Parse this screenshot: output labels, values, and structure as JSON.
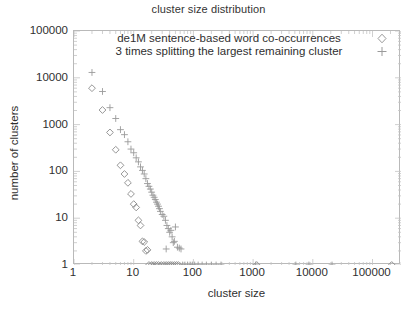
{
  "chart_data": {
    "type": "scatter",
    "title": "cluster size distribution",
    "xlabel": "cluster size",
    "ylabel": "number of clusters",
    "xscale": "log",
    "yscale": "log",
    "xlim": [
      1,
      300000
    ],
    "ylim": [
      1,
      100000
    ],
    "xticks": [
      1,
      10,
      100,
      1000,
      10000,
      100000
    ],
    "xtick_labels": [
      "1",
      "10",
      "100",
      "1000",
      "10000",
      "100000"
    ],
    "yticks": [
      1,
      10,
      100,
      1000,
      10000,
      100000
    ],
    "ytick_labels": [
      "1",
      "10",
      "100",
      "1000",
      "10000",
      "100000"
    ],
    "grid": false,
    "minor_ticks": true,
    "legend_position": "top-center-inside",
    "series": [
      {
        "name": "de1M sentence-based word co-occurrences",
        "marker": "diamond",
        "color": "#8a8a8a",
        "points": [
          [
            2,
            6000
          ],
          [
            3,
            2050
          ],
          [
            4,
            680
          ],
          [
            5,
            290
          ],
          [
            6,
            135
          ],
          [
            7,
            88
          ],
          [
            8,
            57
          ],
          [
            9,
            33
          ],
          [
            10,
            20
          ],
          [
            11,
            17
          ],
          [
            12,
            9
          ],
          [
            13,
            7
          ],
          [
            14,
            3.2
          ],
          [
            15,
            3.1
          ],
          [
            16,
            2
          ],
          [
            17,
            2.1
          ],
          [
            18,
            1
          ],
          [
            20,
            1
          ],
          [
            22,
            1
          ],
          [
            24,
            1
          ],
          [
            26,
            1
          ],
          [
            29,
            1
          ],
          [
            32,
            1
          ],
          [
            35,
            1
          ],
          [
            38,
            1
          ],
          [
            41,
            1
          ],
          [
            44,
            1
          ],
          [
            48,
            1
          ],
          [
            52,
            1
          ],
          [
            56,
            1
          ],
          [
            1150,
            1
          ],
          [
            210000,
            1
          ]
        ]
      },
      {
        "name": "3 times splitting the largest remaining cluster",
        "marker": "plus",
        "color": "#9a9a9a",
        "points": [
          [
            2,
            13000
          ],
          [
            3,
            5100
          ],
          [
            4,
            2300
          ],
          [
            5,
            1350
          ],
          [
            6,
            780
          ],
          [
            7,
            610
          ],
          [
            8,
            430
          ],
          [
            9,
            300
          ],
          [
            10,
            250
          ],
          [
            11,
            195
          ],
          [
            12,
            160
          ],
          [
            13,
            125
          ],
          [
            14,
            105
          ],
          [
            15,
            88
          ],
          [
            16,
            70
          ],
          [
            17,
            55
          ],
          [
            18,
            48
          ],
          [
            19,
            42
          ],
          [
            20,
            36
          ],
          [
            21,
            31
          ],
          [
            22,
            28
          ],
          [
            23,
            25
          ],
          [
            24,
            22
          ],
          [
            25,
            20
          ],
          [
            26,
            18
          ],
          [
            27,
            16
          ],
          [
            28,
            14
          ],
          [
            30,
            12
          ],
          [
            32,
            11
          ],
          [
            34,
            9
          ],
          [
            36,
            7
          ],
          [
            38,
            6
          ],
          [
            40,
            5
          ],
          [
            42,
            5.5
          ],
          [
            44,
            4
          ],
          [
            46,
            3
          ],
          [
            48,
            3.2
          ],
          [
            50,
            6.5
          ],
          [
            54,
            2.4
          ],
          [
            58,
            2.3
          ],
          [
            62,
            2.2
          ],
          [
            35,
            2.2
          ],
          [
            66,
            1
          ],
          [
            72,
            1
          ],
          [
            80,
            1
          ],
          [
            88,
            1
          ],
          [
            96,
            1
          ],
          [
            105,
            1
          ],
          [
            120,
            1
          ],
          [
            140,
            1
          ],
          [
            165,
            1
          ],
          [
            200,
            1
          ],
          [
            240,
            1
          ],
          [
            290,
            1
          ],
          [
            1100,
            1
          ],
          [
            5200,
            1
          ],
          [
            8600,
            1
          ],
          [
            21000,
            1
          ]
        ]
      }
    ]
  },
  "axes": {
    "title": "cluster size distribution",
    "x_title": "cluster size",
    "y_title": "number of clusters"
  },
  "legend": {
    "entries": [
      {
        "label": "de1M sentence-based word co-occurrences",
        "marker": "diamond"
      },
      {
        "label": "3 times splitting the largest remaining cluster",
        "marker": "plus"
      }
    ]
  }
}
